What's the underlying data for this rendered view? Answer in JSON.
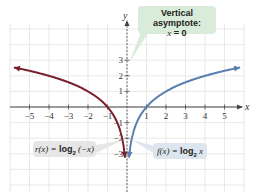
{
  "chart_data": {
    "type": "line",
    "title": "",
    "xlabel": "x",
    "ylabel": "y",
    "xlim": [
      -6,
      6
    ],
    "ylim": [
      -3.5,
      5
    ],
    "grid": true,
    "x_ticks": [
      "-5",
      "-4",
      "-3",
      "-2",
      "-1",
      "1",
      "2",
      "3",
      "4",
      "5"
    ],
    "y_ticks": [
      "3",
      "2",
      "1",
      "-1",
      "-2",
      "-3"
    ],
    "series": [
      {
        "name": "r(x) = log2(-x)",
        "color": "#7a1f2e",
        "x": [
          -5.8,
          -5,
          -4,
          -3,
          -2,
          -1,
          -0.5,
          -0.25,
          -0.125
        ],
        "y": [
          2.54,
          2.32,
          2,
          1.58,
          1,
          0,
          -1,
          -2,
          -3
        ]
      },
      {
        "name": "f(x) = log2 x",
        "color": "#5a7fae",
        "x": [
          0.125,
          0.25,
          0.5,
          1,
          2,
          3,
          4,
          5,
          5.8
        ],
        "y": [
          -3,
          -2,
          -1,
          0,
          1,
          1.58,
          2,
          2.32,
          2.54
        ]
      }
    ],
    "annotations": [
      {
        "text": "Vertical asymptote: x = 0",
        "target": "y-axis"
      },
      {
        "text": "r(x) = log2 (-x)",
        "target": "left curve"
      },
      {
        "text": "f(x) = log2 x",
        "target": "right curve"
      }
    ]
  },
  "labels": {
    "x_axis": "x",
    "y_axis": "y",
    "asymptote_line1": "Vertical asymptote:",
    "asymptote_line2_var": "x",
    "asymptote_line2_rest": " = 0",
    "r_label_fn": "r(x) = ",
    "r_label_log": "log",
    "r_label_sub": "2",
    "r_label_arg": " (−x)",
    "f_label_fn": "f(x) = ",
    "f_label_log": "log",
    "f_label_sub": "2",
    "f_label_arg": " x"
  }
}
